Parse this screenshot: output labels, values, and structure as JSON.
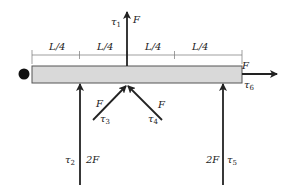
{
  "diagram": {
    "title": "",
    "beam": {
      "fill": "#d9d9d9",
      "stroke": "#555555"
    },
    "support": {
      "type": "pivot-dot",
      "color": "#111111"
    },
    "dimensions": {
      "segment_label": "L/4",
      "segments": [
        "L/4",
        "L/4",
        "L/4",
        "L/4"
      ]
    },
    "forces": [
      {
        "id": "tau1",
        "torque_symbol": "τ",
        "torque_index": "1",
        "magnitude": "F",
        "direction": "up",
        "position_fraction": 0.5
      },
      {
        "id": "tau2",
        "torque_symbol": "τ",
        "torque_index": "2",
        "magnitude": "2F",
        "direction": "up",
        "position_fraction": 0.25
      },
      {
        "id": "tau3",
        "torque_symbol": "τ",
        "torque_index": "3",
        "magnitude": "F",
        "direction": "up-right",
        "position_fraction": 0.5
      },
      {
        "id": "tau4",
        "torque_symbol": "τ",
        "torque_index": "4",
        "magnitude": "F",
        "direction": "up-left",
        "position_fraction": 0.5
      },
      {
        "id": "tau5",
        "torque_symbol": "τ",
        "torque_index": "5",
        "magnitude": "2F",
        "direction": "up",
        "position_fraction": 0.9
      },
      {
        "id": "tau6",
        "torque_symbol": "τ",
        "torque_index": "6",
        "magnitude": "F",
        "direction": "right",
        "position_fraction": 1.0
      }
    ],
    "arrow_color": "#222222"
  }
}
